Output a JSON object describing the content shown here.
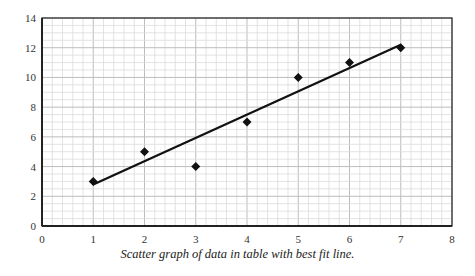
{
  "chart_data": {
    "type": "scatter",
    "title": "",
    "caption": "Scatter graph of data in table with best fit line.",
    "xlabel": "",
    "ylabel": "",
    "xlim": [
      0,
      8
    ],
    "ylim": [
      0,
      14
    ],
    "x_ticks": [
      0,
      1,
      2,
      3,
      4,
      5,
      6,
      7,
      8
    ],
    "y_ticks": [
      0,
      2,
      4,
      6,
      8,
      10,
      12,
      14
    ],
    "grid": true,
    "legend": null,
    "series": [
      {
        "name": "data",
        "marker": "diamond",
        "points": [
          {
            "x": 1,
            "y": 3
          },
          {
            "x": 2,
            "y": 5
          },
          {
            "x": 3,
            "y": 4
          },
          {
            "x": 4,
            "y": 7
          },
          {
            "x": 5,
            "y": 10
          },
          {
            "x": 6,
            "y": 11
          },
          {
            "x": 7,
            "y": 12
          }
        ]
      }
    ],
    "best_fit_line": {
      "x1": 1,
      "y1": 2.8,
      "x2": 7,
      "y2": 12.2
    }
  },
  "colors": {
    "axis": "#222222",
    "grid_major": "#bdbdbd",
    "grid_minor": "#dcdcdc",
    "marker": "#111111",
    "line": "#111111"
  }
}
